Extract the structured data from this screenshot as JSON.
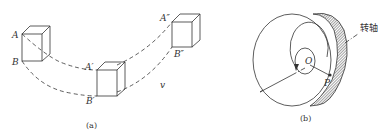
{
  "figure_a": {
    "caption": "(a)",
    "labels": {
      "A": "A",
      "B": "B",
      "A1": "A′",
      "B1": "B′",
      "A2": "A″",
      "B2": "B″",
      "v": "v"
    }
  },
  "figure_b": {
    "caption": "(b)",
    "labels": {
      "O": "O",
      "P": "P",
      "axis": "转轴"
    }
  },
  "colors": {
    "stroke": "#333333",
    "background": "#ffffff"
  }
}
